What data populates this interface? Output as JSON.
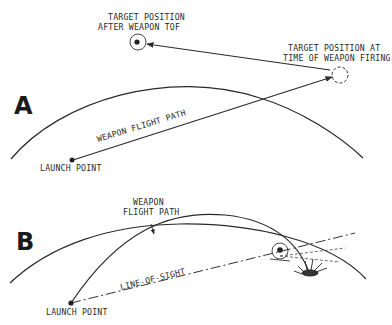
{
  "diagram": {
    "panel_a": {
      "label": "A",
      "target_after_tof": [
        "TARGET POSITION",
        "AFTER WEAPON TOF"
      ],
      "target_at_firing": [
        "TARGET POSITION AT",
        "TIME OF WEAPON FIRING"
      ],
      "flight_path": "WEAPON FLIGHT PATH",
      "launch_point": "LAUNCH POINT"
    },
    "panel_b": {
      "label": "B",
      "flight_path": [
        "WEAPON",
        "FLIGHT PATH"
      ],
      "line_of_sight": "LINE-OF-SIGHT",
      "launch_point": "LAUNCH POINT"
    },
    "colors": {
      "ink": "#2a2a2a",
      "background": "#ffffff"
    }
  }
}
